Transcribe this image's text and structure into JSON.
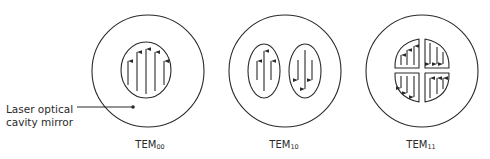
{
  "diagram": {
    "callout": {
      "line1": "Laser optical",
      "line2": "cavity mirror"
    },
    "modes": [
      {
        "id": "TEM00",
        "prefix": "TEM",
        "subscript": "00",
        "lobes": 1,
        "arrows": "all up"
      },
      {
        "id": "TEM10",
        "prefix": "TEM",
        "subscript": "10",
        "lobes": 2,
        "arrows": "left up, right down"
      },
      {
        "id": "TEM11",
        "prefix": "TEM",
        "subscript": "11",
        "lobes": 4,
        "arrows": "top-left up, top-right down, bottom-left down, bottom-right up"
      }
    ],
    "colors": {
      "stroke": "#2a2a2a",
      "background": "#ffffff"
    }
  }
}
